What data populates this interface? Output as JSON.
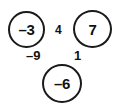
{
  "diagram": {
    "type": "number-circle-diagram",
    "background_color": "#ffffff",
    "stroke_color": "#1a1a1a",
    "text_color": "#111111",
    "nodes": [
      {
        "id": "a",
        "label": "–3",
        "value": -3,
        "position": "top-left"
      },
      {
        "id": "b",
        "label": "7",
        "value": 7,
        "position": "top-right"
      },
      {
        "id": "c",
        "label": "–6",
        "value": -6,
        "position": "bottom-center"
      }
    ],
    "edge_labels": [
      {
        "id": "ab",
        "label": "4",
        "value": 4,
        "between": "top-left and top-right"
      },
      {
        "id": "ac",
        "label": "–9",
        "value": -9,
        "between": "top-left and bottom-center"
      },
      {
        "id": "bc",
        "label": "1",
        "value": 1,
        "between": "top-right and bottom-center"
      }
    ]
  },
  "chart_data": {
    "type": "diagram",
    "title": "",
    "categories": [
      "–3",
      "7",
      "–6"
    ],
    "values": [
      -3,
      7,
      -6
    ],
    "annotations": [
      "4",
      "–9",
      "1"
    ]
  }
}
